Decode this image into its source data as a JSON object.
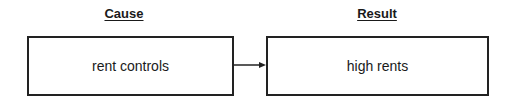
{
  "cause": {
    "heading": "Cause",
    "box_text": "rent controls"
  },
  "result": {
    "heading": "Result",
    "box_text": "high rents"
  },
  "connector": {
    "type": "arrow",
    "direction": "cause-to-result"
  }
}
